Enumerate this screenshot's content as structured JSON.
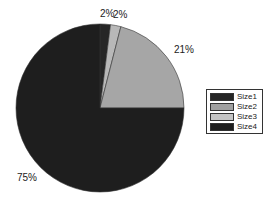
{
  "chart_data": {
    "type": "pie",
    "title": "",
    "categories": [
      "Size1",
      "Size2",
      "Size3",
      "Size4"
    ],
    "values": [
      2,
      2,
      21,
      75
    ],
    "labels": [
      "2%",
      "2%",
      "21%",
      "75%"
    ],
    "colors": [
      "#262626",
      "#b8b8b8",
      "#a6a6a6",
      "#1e1e1e"
    ],
    "legend_position": "right"
  },
  "legend": {
    "items": [
      {
        "label": "Size1",
        "color": "#262626"
      },
      {
        "label": "Size2",
        "color": "#a0a0a0"
      },
      {
        "label": "Size3",
        "color": "#c4c4c4"
      },
      {
        "label": "Size4",
        "color": "#1e1e1e"
      }
    ]
  }
}
